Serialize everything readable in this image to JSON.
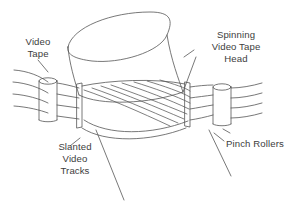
{
  "figure": {
    "background_color": "#ffffff",
    "line_color": "#555555",
    "text_color": "#3d3d3d"
  },
  "labels": {
    "video_tape": "Video\nTape",
    "video_tape_line1": "Video",
    "video_tape_line2": "Tape",
    "spinning_head_line1": "Spinning",
    "spinning_head_line2": "Video Tape",
    "spinning_head_line3": "Head",
    "slanted_tracks_line1": "Slanted",
    "slanted_tracks_line2": "Video",
    "slanted_tracks_line3": "Tracks",
    "pinch_rollers": "Pinch Rollers"
  },
  "parts": {
    "drum": "spinning video tape head drum",
    "tape": "magnetic video tape ribbon",
    "tracks": "slanted recorded video tracks",
    "left_roller": "left pinch roller",
    "right_roller": "right pinch roller",
    "left_guide": "left tape guide post",
    "right_guide": "right tape guide post"
  }
}
